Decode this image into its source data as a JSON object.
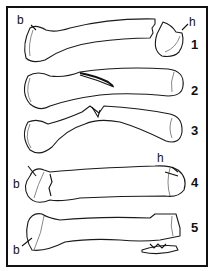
{
  "figure": {
    "border_color": "#111111",
    "background": "#ffffff",
    "specimens": [
      {
        "number": "1",
        "labels": [
          "b",
          "h"
        ]
      },
      {
        "number": "2",
        "labels": []
      },
      {
        "number": "3",
        "labels": []
      },
      {
        "number": "4",
        "labels": [
          "b",
          "h"
        ]
      },
      {
        "number": "5",
        "labels": [
          "b"
        ]
      }
    ],
    "label_text": {
      "n1": "1",
      "n2": "2",
      "n3": "3",
      "n4": "4",
      "n5": "5",
      "b1": "b",
      "h1": "h",
      "b4": "b",
      "h4": "h",
      "b5": "b"
    }
  }
}
